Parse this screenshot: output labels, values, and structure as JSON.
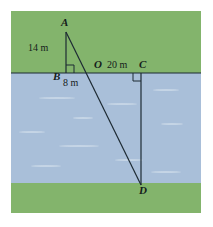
{
  "figure": {
    "colors": {
      "grass": "#83b46c",
      "water": "#a9bfd9",
      "ripple": "#cfdcea",
      "stroke": "#1d2a33",
      "background": "#ffffff"
    },
    "bands": {
      "top_grass": {
        "label": "near-shore-grass",
        "y": 0,
        "height": 62
      },
      "water": {
        "label": "river-water",
        "y": 62,
        "height": 110
      },
      "bottom_grass": {
        "label": "far-shore-grass",
        "y": 172,
        "height": 30
      }
    },
    "points": [
      {
        "id": "A",
        "label": "A",
        "x": 55,
        "y": 21,
        "name": "point-a"
      },
      {
        "id": "B",
        "label": "B",
        "x": 55,
        "y": 62,
        "name": "point-b"
      },
      {
        "id": "O",
        "label": "O",
        "x": 82,
        "y": 62,
        "name": "point-o"
      },
      {
        "id": "C",
        "label": "C",
        "x": 130,
        "y": 62,
        "name": "point-c"
      },
      {
        "id": "D",
        "label": "D",
        "x": 130,
        "y": 174,
        "name": "point-d"
      }
    ],
    "segments": [
      {
        "name": "segment-ab",
        "from": "A",
        "to": "B"
      },
      {
        "name": "segment-aod",
        "from": "A",
        "to": "D"
      },
      {
        "name": "segment-bc",
        "from": "B",
        "to": "C"
      },
      {
        "name": "segment-cd",
        "from": "C",
        "to": "D"
      }
    ],
    "measurements": [
      {
        "name": "measure-ab",
        "value": "14 m",
        "segment": "AB"
      },
      {
        "name": "measure-bo",
        "value": "8 m",
        "segment": "BO"
      },
      {
        "name": "measure-oc",
        "value": "20 m",
        "segment": "OC"
      }
    ],
    "right_angles": [
      {
        "name": "right-angle-b",
        "vertex": "B",
        "position": "above-right"
      },
      {
        "name": "right-angle-c",
        "vertex": "C",
        "position": "below-left"
      }
    ],
    "labels": {
      "a": "A",
      "b": "B",
      "o": "O",
      "c": "C",
      "d": "D",
      "ab_length": "14 m",
      "bo_length": "8 m",
      "oc_length": "20 m"
    }
  }
}
